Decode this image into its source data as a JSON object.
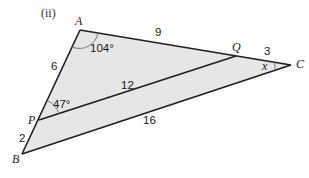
{
  "part_label": "(ii)",
  "colors": {
    "fill": "#e6e6e6",
    "stroke": "#1f1f1f",
    "arc": "#777777",
    "background": "#ffffff"
  },
  "vertices": {
    "A": {
      "label": "A",
      "x": 80,
      "y": 30
    },
    "Q": {
      "label": "Q",
      "x": 236,
      "y": 56
    },
    "C": {
      "label": "C",
      "x": 291,
      "y": 65
    },
    "P": {
      "label": "P",
      "x": 39,
      "y": 120
    },
    "B": {
      "label": "B",
      "x": 22,
      "y": 154
    }
  },
  "segments": {
    "AP": "6",
    "PB": "2",
    "AQ": "9",
    "QC": "3",
    "PQ": "12",
    "BC": "16"
  },
  "angles": {
    "A": "104°",
    "P": "47°",
    "C": "x"
  }
}
